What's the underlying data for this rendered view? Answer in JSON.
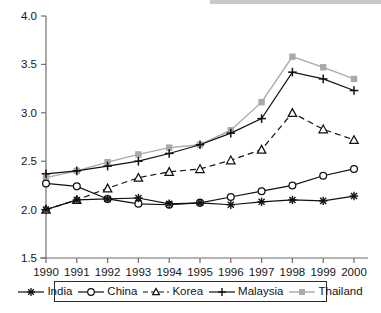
{
  "chart_data": {
    "type": "line",
    "title": "",
    "subtitle": "",
    "xlabel": "",
    "ylabel": "",
    "x": [
      1990,
      1991,
      1992,
      1993,
      1994,
      1995,
      1996,
      1997,
      1998,
      1999,
      2000
    ],
    "xtick_labels": [
      "1990",
      "1991",
      "1992",
      "1993",
      "1994",
      "1995",
      "1996",
      "1997",
      "1998",
      "1999",
      "2000"
    ],
    "ytick_labels": [
      "1.5",
      "2.0",
      "2.5",
      "3.0",
      "3.5",
      "4.0"
    ],
    "ytick_values": [
      1.5,
      2.0,
      2.5,
      3.0,
      3.5,
      4.0
    ],
    "ylim": [
      1.5,
      4.0
    ],
    "xlim": [
      1990,
      2000
    ],
    "grid": false,
    "legend_position": "bottom",
    "series": [
      {
        "name": "India",
        "marker": "asterisk",
        "linestyle": "solid",
        "color": "#111111",
        "values": [
          2.0,
          2.1,
          2.11,
          2.12,
          2.06,
          2.07,
          2.05,
          2.08,
          2.1,
          2.09,
          2.14
        ]
      },
      {
        "name": "China",
        "marker": "open-circle",
        "linestyle": "solid",
        "color": "#111111",
        "values": [
          2.27,
          2.24,
          2.11,
          2.06,
          2.05,
          2.07,
          2.13,
          2.19,
          2.25,
          2.35,
          2.42
        ]
      },
      {
        "name": "Korea",
        "marker": "open-triangle",
        "linestyle": "dashed",
        "color": "#111111",
        "values": [
          2.0,
          2.1,
          2.22,
          2.33,
          2.39,
          2.42,
          2.51,
          2.62,
          3.0,
          2.83,
          2.72
        ]
      },
      {
        "name": "Malaysia",
        "marker": "plus",
        "linestyle": "solid",
        "color": "#111111",
        "values": [
          2.37,
          2.4,
          2.45,
          2.5,
          2.58,
          2.67,
          2.79,
          2.94,
          3.42,
          3.35,
          3.23
        ]
      },
      {
        "name": "Thailand",
        "marker": "filled-square",
        "linestyle": "solid",
        "color": "#a9a9a9",
        "values": [
          2.33,
          2.4,
          2.49,
          2.57,
          2.64,
          2.67,
          2.82,
          3.11,
          3.58,
          3.47,
          3.35
        ]
      }
    ]
  },
  "legend": {
    "entries": [
      {
        "label": "India"
      },
      {
        "label": "China"
      },
      {
        "label": "Korea"
      },
      {
        "label": "Malaysia"
      },
      {
        "label": "Thailand"
      }
    ]
  },
  "colors": {
    "axis": "#6f6f6f",
    "text": "#161616",
    "thailand_gray": "#a9a9a9",
    "series_black": "#111111"
  }
}
